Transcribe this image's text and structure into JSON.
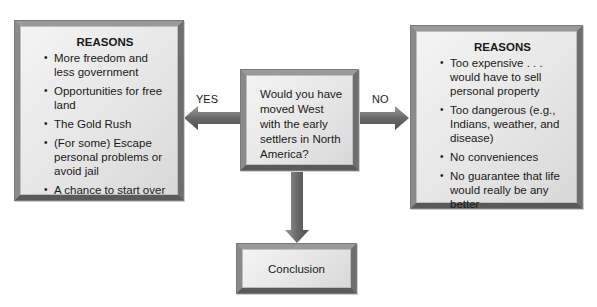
{
  "question": "Would you have moved West with the early settlers in North America?",
  "yes_branch": {
    "label": "YES",
    "heading": "REASONS",
    "items": [
      "More freedom and less government",
      "Opportunities for free land",
      "The Gold Rush",
      "(For some) Escape personal problems or avoid jail",
      "A chance to start over"
    ]
  },
  "no_branch": {
    "label": "NO",
    "heading": "REASONS",
    "items": [
      "Too expensive . . . would have to sell personal property",
      "Too dangerous (e.g., Indians, weather, and disease)",
      "No conveniences",
      "No guarantee that life would really be any better"
    ]
  },
  "conclusion": {
    "label": "Conclusion"
  }
}
